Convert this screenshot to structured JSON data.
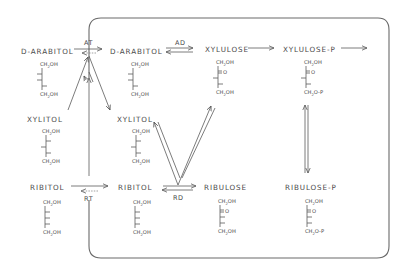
{
  "diagram": {
    "compounds": {
      "d_arabitol_outside": "D-ARABITOL",
      "xylitol_outside": "XYLITOL",
      "ribitol_outside": "RIBITOL",
      "d_arabitol_inside": "D-ARABITOL",
      "xylitol_inside": "XYLITOL",
      "ribitol_inside": "RIBITOL",
      "xylulose": "XYLULOSE",
      "xylulose_p": "XYLULOSE-P",
      "ribulose": "RIBULOSE",
      "ribulose_p": "RIBULOSE-P"
    },
    "enzymes": {
      "arabitol_transport": "AT",
      "arabitol_dehydrogenase": "AD",
      "ribitol_transport": "RT",
      "ribitol_dehydrogenase": "RD"
    },
    "structure_groups": {
      "ch2oh_prefix": "CH",
      "ch2oh_sub": "2",
      "ch2oh_suffix": "OH",
      "ch2op_suffix": "O-P",
      "keto": "O"
    },
    "colors": {
      "ink": "#4a4a4a",
      "frame": "#6a6a6a",
      "background": "#ffffff"
    }
  }
}
